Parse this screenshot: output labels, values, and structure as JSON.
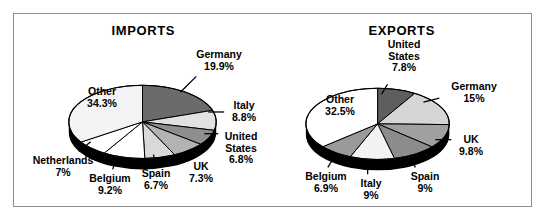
{
  "figure": {
    "background": "#ffffff",
    "frame_color": "#8d8d8d"
  },
  "chart_data": [
    {
      "type": "pie",
      "title": "IMPORTS",
      "categories": [
        "Germany",
        "Italy",
        "United States",
        "UK",
        "Spain",
        "Belgium",
        "Netherlands",
        "Other"
      ],
      "values": [
        19.9,
        8.8,
        6.8,
        7.3,
        6.7,
        9.2,
        7.0,
        34.3
      ],
      "labels": [
        "Germany\n19.9%",
        "Italy\n8.8%",
        "United\nStates\n6.8%",
        "UK\n7.3%",
        "Spain\n6.7%",
        "Belgium\n9.2%",
        "Netherlands\n7%",
        "Other\n34.3%"
      ],
      "slice_colors": [
        "#6b6b6b",
        "#e2e2e2",
        "#8f8f8f",
        "#b3b3b3",
        "#d9d9d9",
        "#ffffff",
        "#ffffff",
        "#f4f4f4"
      ],
      "unit": "%",
      "legend": "none",
      "grid": false
    },
    {
      "type": "pie",
      "title": "EXPORTS",
      "categories": [
        "United States",
        "Germany",
        "UK",
        "Spain",
        "Italy",
        "Belgium",
        "Other"
      ],
      "values": [
        7.8,
        15.0,
        9.8,
        9.0,
        9.0,
        6.9,
        32.5
      ],
      "labels": [
        "United\nStates\n7.8%",
        "Germany\n15%",
        "UK\n9.8%",
        "Spain\n9%",
        "Italy\n9%",
        "Belgium\n6.9%",
        "Other\n32.5%"
      ],
      "slice_colors": [
        "#5e5e5e",
        "#d6d6d6",
        "#a0a0a0",
        "#8c8c8c",
        "#f2f2f2",
        "#9a9a9a",
        "#ffffff"
      ],
      "unit": "%",
      "legend": "none",
      "grid": false
    }
  ],
  "layout": {
    "imports": {
      "center_x": 142,
      "center_y": 122,
      "rx": 74,
      "ry": 37,
      "depth": 11,
      "start_angle": -90,
      "label_positions": [
        {
          "left": 178,
          "top": 48,
          "w": 80,
          "lx1": 196,
          "ly1": 76,
          "lx2": 180,
          "ly2": 92
        },
        {
          "left": 218,
          "top": 99,
          "w": 50,
          "lx1": 208,
          "ly1": 112,
          "lx2": 224,
          "ly2": 112
        },
        {
          "left": 212,
          "top": 130,
          "w": 56,
          "lx1": 204,
          "ly1": 134,
          "lx2": 218,
          "ly2": 134
        },
        {
          "left": 180,
          "top": 160,
          "w": 40,
          "lx1": 186,
          "ly1": 152,
          "lx2": 192,
          "ly2": 158
        },
        {
          "left": 130,
          "top": 167,
          "w": 50,
          "lx1": 153,
          "ly1": 155,
          "lx2": 155,
          "ly2": 165
        },
        {
          "left": 78,
          "top": 172,
          "w": 62,
          "lx1": 116,
          "ly1": 158,
          "lx2": 112,
          "ly2": 170
        },
        {
          "left": 18,
          "top": 154,
          "w": 88,
          "lx1": 90,
          "ly1": 142,
          "lx2": 78,
          "ly2": 152
        },
        {
          "left": 68,
          "top": 85,
          "w": 66,
          "lx1": 0,
          "ly1": 0,
          "lx2": 0,
          "ly2": 0
        }
      ]
    },
    "exports": {
      "center_x": 378,
      "center_y": 124,
      "rx": 72,
      "ry": 36,
      "depth": 11,
      "start_angle": -90,
      "label_positions": [
        {
          "left": 372,
          "top": 38,
          "w": 62,
          "lx1": 388,
          "ly1": 84,
          "lx2": 382,
          "ly2": 94
        },
        {
          "left": 440,
          "top": 80,
          "w": 66,
          "lx1": 424,
          "ly1": 102,
          "lx2": 440,
          "ly2": 98
        },
        {
          "left": 448,
          "top": 133,
          "w": 44,
          "lx1": 436,
          "ly1": 140,
          "lx2": 452,
          "ly2": 140
        },
        {
          "left": 400,
          "top": 170,
          "w": 48,
          "lx1": 410,
          "ly1": 157,
          "lx2": 416,
          "ly2": 168
        },
        {
          "left": 350,
          "top": 177,
          "w": 40,
          "lx1": 368,
          "ly1": 160,
          "lx2": 368,
          "ly2": 175
        },
        {
          "left": 294,
          "top": 170,
          "w": 62,
          "lx1": 336,
          "ly1": 155,
          "lx2": 328,
          "ly2": 168
        },
        {
          "left": 308,
          "top": 93,
          "w": 62,
          "lx1": 0,
          "ly1": 0,
          "lx2": 0,
          "ly2": 0
        }
      ]
    }
  }
}
